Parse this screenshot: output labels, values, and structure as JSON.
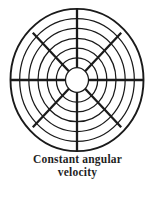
{
  "figure": {
    "caption": {
      "line1": "Constant angular",
      "line2": "velocity"
    },
    "wheel": {
      "center_x": 77,
      "center_y": 80,
      "num_rings": 7,
      "hub_radius": 11.5,
      "outer_radius": 66.5,
      "y_scale": 1.07,
      "num_spokes": 8,
      "cardinal_spoke_end_radius": 66.5,
      "diagonal_spoke_end_radius": 62.5,
      "ring_stroke_width": 1.25,
      "outer_ring_stroke_width": 1.9,
      "spoke_stroke_width": 2.3
    }
  },
  "colors": {
    "background": "#ffffff",
    "ink": "#1a1a1a",
    "caption_text": "#1f1f1f"
  }
}
